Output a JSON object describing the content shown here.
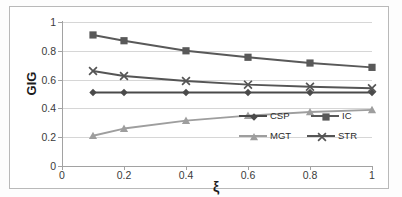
{
  "chart_data": {
    "type": "line",
    "title": "",
    "xlabel": "ξ",
    "ylabel": "GIG",
    "x": [
      0.1,
      0.2,
      0.4,
      0.6,
      0.8,
      1.0
    ],
    "xlim": [
      0,
      1
    ],
    "ylim": [
      0,
      1
    ],
    "xticks": [
      "0",
      "0.2",
      "0.4",
      "0.6",
      "0.8",
      "1"
    ],
    "xtick_values": [
      0,
      0.2,
      0.4,
      0.6,
      0.8,
      1
    ],
    "yticks": [
      "0",
      "0.2",
      "0.4",
      "0.6",
      "0.8",
      "1"
    ],
    "ytick_values": [
      0,
      0.2,
      0.4,
      0.6,
      0.8,
      1
    ],
    "grid": "horizontal",
    "legend_position": "inside-lower-right",
    "series": [
      {
        "name": "CSP",
        "marker": "diamond",
        "color": "#4a4a4a",
        "values": [
          0.51,
          0.51,
          0.51,
          0.51,
          0.51,
          0.51
        ]
      },
      {
        "name": "IC",
        "marker": "square",
        "color": "#595959",
        "values": [
          0.91,
          0.87,
          0.8,
          0.755,
          0.715,
          0.685
        ]
      },
      {
        "name": "MGT",
        "marker": "triangle",
        "color": "#9e9e9e",
        "values": [
          0.21,
          0.26,
          0.315,
          0.35,
          0.375,
          0.39
        ]
      },
      {
        "name": "STR",
        "marker": "x",
        "color": "#555555",
        "values": [
          0.66,
          0.625,
          0.59,
          0.565,
          0.55,
          0.54
        ]
      }
    ]
  }
}
